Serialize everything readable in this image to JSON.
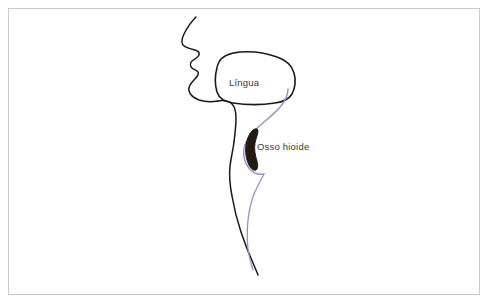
{
  "figure": {
    "name": "diagrama-sagital-cabeca-pescoco",
    "background_color": "#ffffff",
    "border_color": "#c9c9c9",
    "profile_stroke_color": "#1a1a1a",
    "pharynx_stroke_color": "#9a92c4",
    "hyoid_fill_color": "#241a14",
    "label_text_color": "#3a3a3a"
  },
  "labels": {
    "tongue": "Língua",
    "hyoid_bone": "Osso hioide"
  },
  "structures": {
    "face_profile_name": "perfil-facial",
    "tongue_name": "lingua-contorno",
    "neck_name": "parede-anterior-pescoco",
    "pharynx_name": "faringe-esofago",
    "hyoid_name": "osso-hioide"
  }
}
